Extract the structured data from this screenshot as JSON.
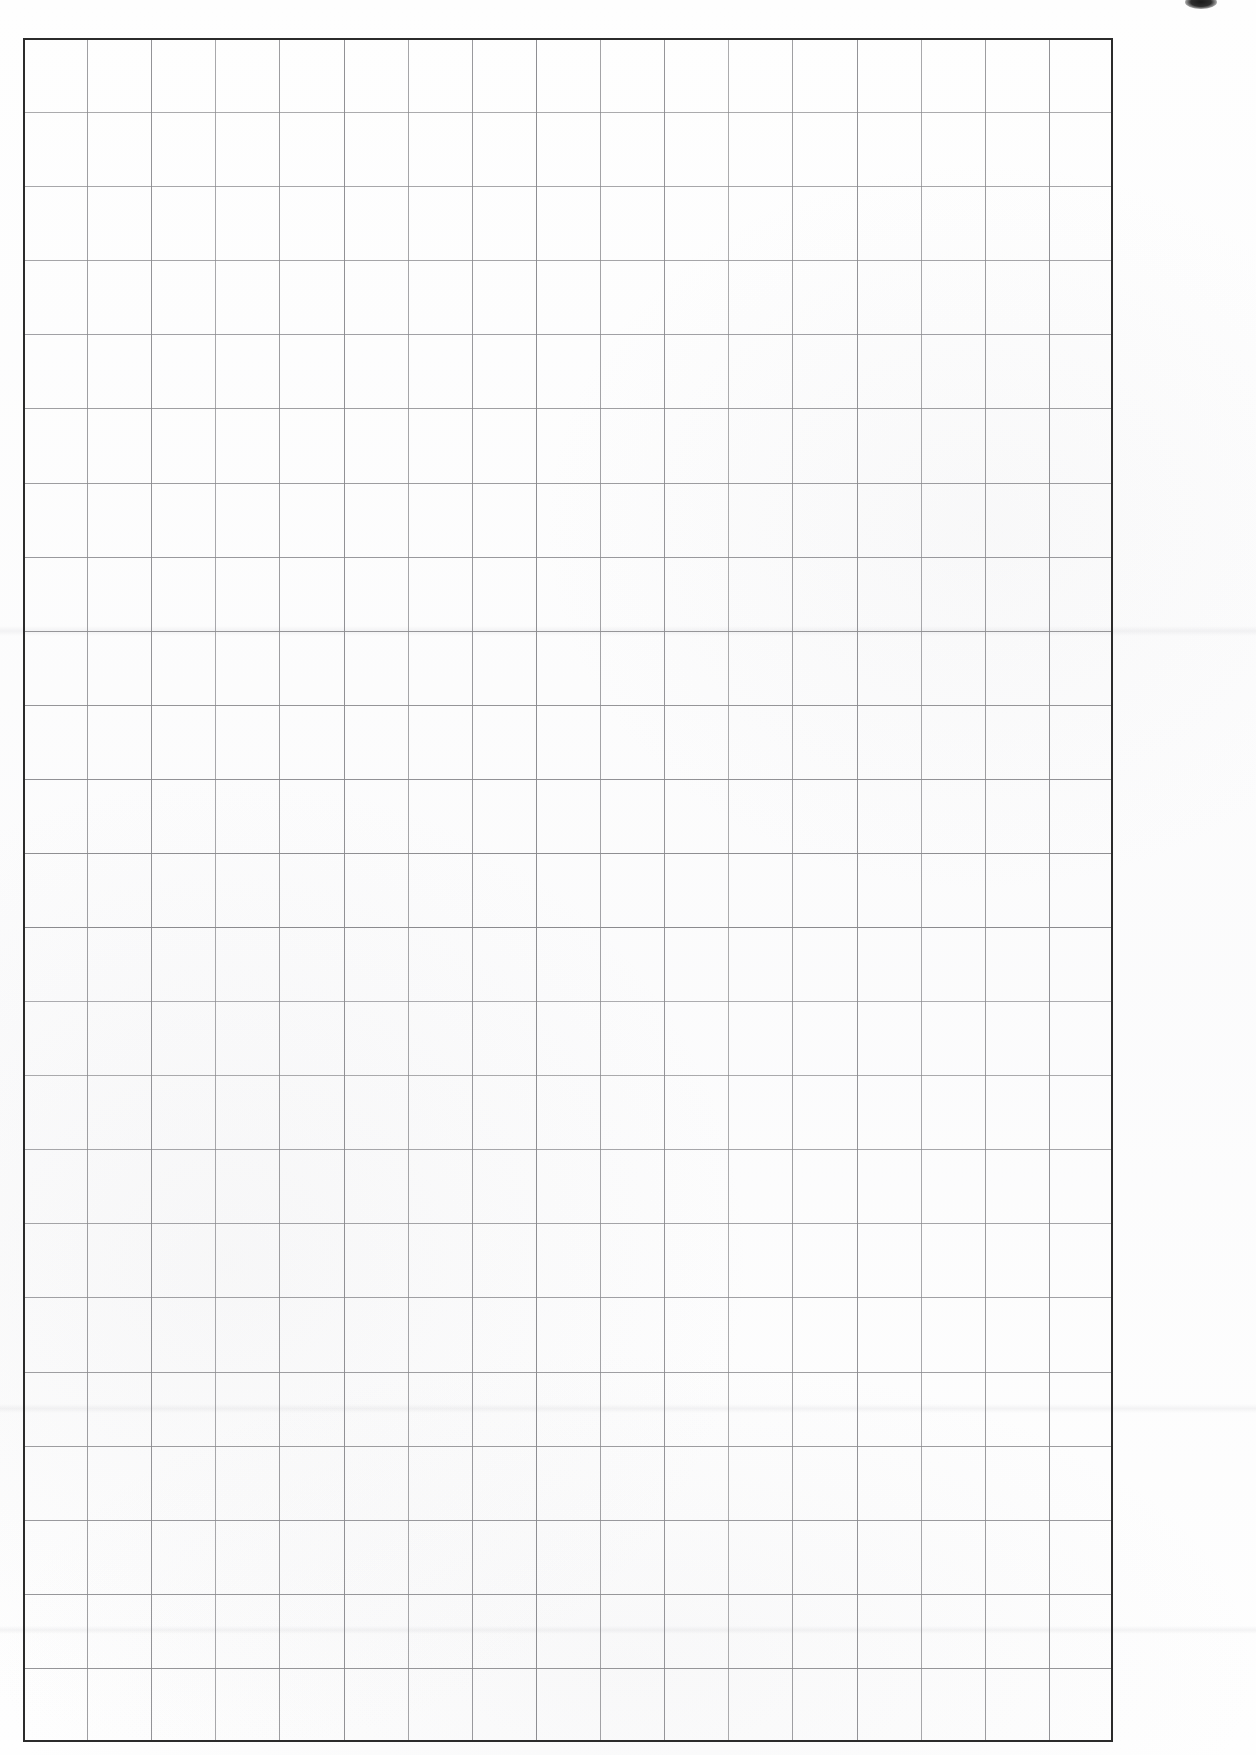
{
  "page": {
    "type": "blank-graph-paper-scan",
    "width": 1256,
    "height": 1755,
    "background_color": "#fefefe",
    "visible_text": "",
    "content_note": "No text, labels, numbers or annotations are present on the sheet"
  },
  "grid": {
    "name": "squared-paper-grid",
    "left": 23,
    "top": 38,
    "right": 1113,
    "bottom": 1742,
    "width": 1090,
    "height": 1704,
    "columns": 17,
    "rows": 23,
    "cell_width": 64.1,
    "cell_height": 74.1,
    "line_color": "#8a8a8e",
    "line_width": 1,
    "border_color": "#2b2b2b",
    "border_width": 2
  },
  "marks": [
    {
      "name": "top-edge-ink-smudge",
      "shape": "ellipse",
      "left": 1185,
      "top": -5,
      "width": 32,
      "height": 14,
      "color": "#1a1a1a"
    }
  ],
  "scan_artifacts": [
    {
      "name": "scan-band-upper",
      "top": 626,
      "height": 10
    },
    {
      "name": "scan-band-mid",
      "top": 1404,
      "height": 9
    },
    {
      "name": "scan-band-lower",
      "top": 1626,
      "height": 8
    }
  ]
}
